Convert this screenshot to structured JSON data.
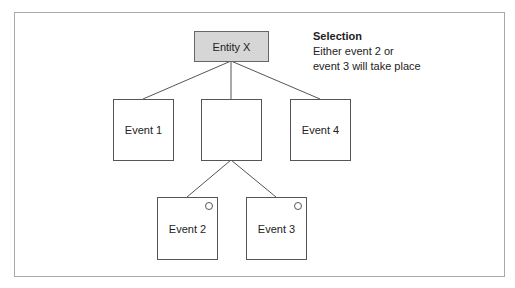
{
  "diagram": {
    "root": {
      "label": "Entity X",
      "fill": "#d6d6d6"
    },
    "level1": [
      {
        "label": "Event 1"
      },
      {
        "label": ""
      },
      {
        "label": "Event 4"
      }
    ],
    "level2": [
      {
        "label": "Event 2",
        "marker": "circle"
      },
      {
        "label": "Event 3",
        "marker": "circle"
      }
    ],
    "note": {
      "title": "Selection",
      "line1": "Either event 2 or",
      "line2": "event 3 will take place"
    }
  }
}
